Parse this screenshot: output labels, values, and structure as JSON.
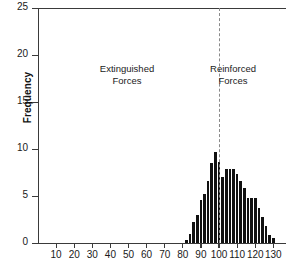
{
  "chart_data": {
    "type": "bar",
    "title": "",
    "subtitle": "",
    "xlabel": "",
    "ylabel": "Frequency",
    "xlim": [
      0,
      137
    ],
    "ylim": [
      0,
      25
    ],
    "grid": false,
    "legend": null,
    "xticks": [
      10,
      20,
      30,
      40,
      50,
      60,
      70,
      80,
      90,
      100,
      110,
      120,
      130
    ],
    "yticks": [
      0,
      5,
      10,
      15,
      20,
      25
    ],
    "bin_width": 2,
    "categories": [
      82,
      84,
      86,
      88,
      90,
      92,
      94,
      96,
      98,
      100,
      102,
      104,
      106,
      108,
      110,
      112,
      114,
      116,
      118,
      120,
      122,
      124,
      126,
      128,
      130
    ],
    "values": [
      0.3,
      1.0,
      2.2,
      3.0,
      4.6,
      5.2,
      6.6,
      8.5,
      9.7,
      8.6,
      7.0,
      7.9,
      7.9,
      7.9,
      7.3,
      6.6,
      5.9,
      4.8,
      4.8,
      4.8,
      3.7,
      2.8,
      1.8,
      0.9,
      0.5
    ],
    "annotations": [
      {
        "id": "extinguished",
        "line1": "Extinguished",
        "line2": "Forces",
        "x_region": "left-of-100"
      },
      {
        "id": "reinforced",
        "line1": "Reinforced",
        "line2": "Forces",
        "x_region": "right-of-100"
      }
    ],
    "reference_line": {
      "x": 100,
      "style": "dashed",
      "color": "#8a8a8a"
    },
    "colors": {
      "bar": "#111111",
      "axis": "#3a3a3a",
      "text": "#1a1a1a",
      "background": "#ffffff"
    }
  }
}
